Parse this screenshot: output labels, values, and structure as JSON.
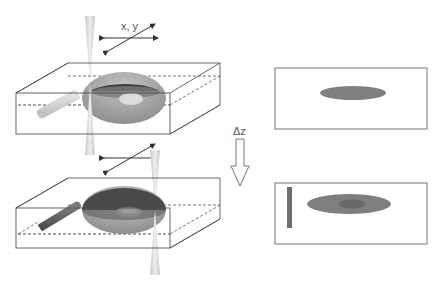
{
  "labels": {
    "xy": "x, y",
    "dz": "Δz"
  },
  "colors": {
    "line": "#555555",
    "ellipse_dark": "#555555",
    "ellipse_mid": "#8a8a8a",
    "ellipse_light": "#b4b4b4",
    "beam": "#d6d6d6",
    "panel_ellipse": "#7f7f7f",
    "panel_inner": "#6a6a6a",
    "panel_bar": "#6e6e6e",
    "dashed": "#444444"
  },
  "panels": [
    {
      "name": "top-view-before",
      "shows": [
        "ellipse"
      ]
    },
    {
      "name": "top-view-after",
      "shows": [
        "bar",
        "ellipse",
        "inner-ellipse"
      ]
    }
  ]
}
